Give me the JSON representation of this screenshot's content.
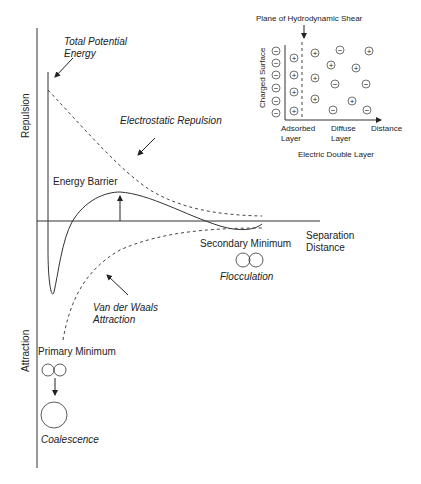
{
  "diagram": {
    "axes": {
      "y_top_label": "Repulsion",
      "y_bottom_label": "Attraction",
      "x_label_line1": "Separation",
      "x_label_line2": "Distance"
    },
    "curves": {
      "total": {
        "label_line1": "Total Potential",
        "label_line2": "Energy",
        "style": "solid"
      },
      "electrostatic": {
        "label": "Electrostatic Repulsion",
        "style": "dashed"
      },
      "vdw": {
        "label_line1": "Van der Waals",
        "label_line2": "Attraction",
        "style": "dashed"
      }
    },
    "annotations": {
      "energy_barrier": "Energy Barrier",
      "secondary_minimum": "Secondary Minimum",
      "flocculation": "Flocculation",
      "primary_minimum": "Primary Minimum",
      "coalescence": "Coalescence"
    },
    "inset": {
      "title": "Plane of Hydrodynamic Shear",
      "y_label": "Charged Surface",
      "x_label": "Distance",
      "adsorbed_line1": "Adsorbed",
      "adsorbed_line2": "Layer",
      "diffuse_line1": "Diffuse",
      "diffuse_line2": "Layer",
      "caption": "Electric Double Layer",
      "surface_charges": [
        "−",
        "−",
        "−",
        "−",
        "−",
        "−"
      ],
      "plus_sign": "+",
      "minus_sign": "−"
    },
    "colors": {
      "line": "#333333",
      "text": "#222222",
      "background": "#ffffff"
    }
  }
}
